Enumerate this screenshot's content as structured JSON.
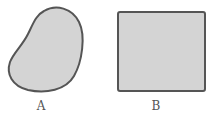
{
  "shapes": [
    {
      "id": "A",
      "label": "A",
      "type": "irregular-blob",
      "fill": "#d4d4d4",
      "stroke": "#555555"
    },
    {
      "id": "B",
      "label": "B",
      "type": "square",
      "fill": "#d4d4d4",
      "stroke": "#555555"
    }
  ]
}
